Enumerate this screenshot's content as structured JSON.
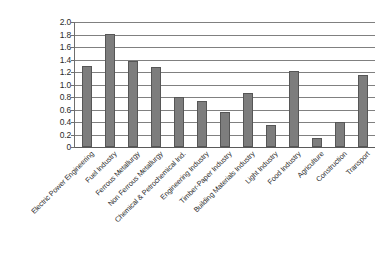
{
  "chart_data": {
    "type": "bar",
    "title": "",
    "subtitle": "",
    "xlabel": "",
    "ylabel": "",
    "ylim": [
      0,
      2.0
    ],
    "ytick_labels": [
      "2.0",
      "1.8",
      "1.6",
      "1.4",
      "1.2",
      "1.0",
      "0.8",
      "0.6",
      "0.4",
      "0.2",
      "0"
    ],
    "ytick_values": [
      2.0,
      1.8,
      1.6,
      1.4,
      1.2,
      1.0,
      0.8,
      0.6,
      0.4,
      0.2,
      0
    ],
    "grid": true,
    "legend": false,
    "legend_position": "none",
    "categories": [
      "Electric Power Engineering",
      "Fuel Industry",
      "Ferrous Metallurgy",
      "Non Ferrous Metallurgy",
      "Chemical & Petrochemical Ind.",
      "Engineering Industry",
      "Timber-Paper Industry",
      "Building Materials Industry",
      "Light Industry",
      "Food Industry",
      "Agriculture",
      "Construction",
      "Transport"
    ],
    "values": [
      1.3,
      1.81,
      1.38,
      1.28,
      0.8,
      0.73,
      0.56,
      0.87,
      0.36,
      1.22,
      0.15,
      0.4,
      1.15
    ],
    "series": [
      {
        "name": "",
        "values": [
          1.3,
          1.81,
          1.38,
          1.28,
          0.8,
          0.73,
          0.56,
          0.87,
          0.36,
          1.22,
          0.15,
          0.4,
          1.15
        ]
      }
    ],
    "colors": {
      "bar_fill": "#7d7d7d",
      "bar_border": "#565656",
      "gridline": "#808080",
      "axis": "#5a5a5a",
      "text": "#2b2b2b",
      "background": "#ffffff"
    }
  }
}
